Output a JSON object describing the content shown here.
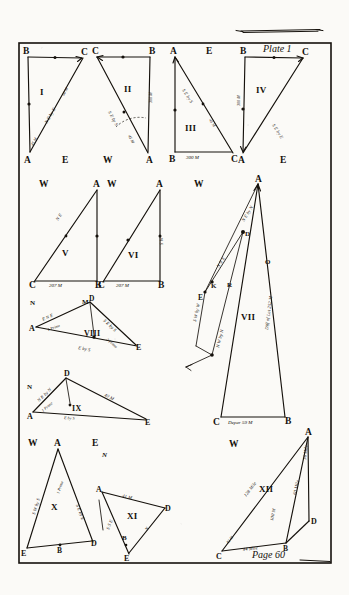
{
  "plate": {
    "title": "Plate 1",
    "page_label": "Page 60",
    "top_rule": "decorative-rule"
  },
  "figures": [
    {
      "id": "fig-1",
      "numeral": "I",
      "vertices": [
        "B",
        "C",
        "A"
      ],
      "outside_labels": [
        "E"
      ],
      "course_label": "N E by E",
      "hypotenuse_distance": "60 M",
      "leg_distance": "45 M"
    },
    {
      "id": "fig-2",
      "numeral": "II",
      "vertices": [
        "C",
        "B",
        "A"
      ],
      "outside_labels": [
        "W"
      ],
      "course_label": "S E by S",
      "hypotenuse_distance": "45 M",
      "leg_distance": "300 M",
      "has_angle_arc": true
    },
    {
      "id": "fig-3",
      "numeral": "III",
      "vertices": [
        "A",
        "B",
        "C"
      ],
      "outside_labels": [
        "E"
      ],
      "course_label": "S E by S",
      "hypotenuse_distance": "45 M",
      "base_distance": "300 M"
    },
    {
      "id": "fig-4",
      "numeral": "IV",
      "vertices": [
        "B",
        "C",
        "A"
      ],
      "outside_labels": [
        "E"
      ],
      "course_label": "S E by E",
      "hypotenuse_distance": "35 M",
      "leg_distance": "300 M"
    },
    {
      "id": "fig-5",
      "numeral": "V",
      "vertices": [
        "A",
        "C",
        "B"
      ],
      "outside_labels": [
        "W"
      ],
      "course_label": "N E",
      "base_distance": "207 M"
    },
    {
      "id": "fig-6",
      "numeral": "VI",
      "vertices": [
        "A",
        "C",
        "B"
      ],
      "outside_labels": [
        "W"
      ],
      "course_label": "S W",
      "base_distance": "207 M"
    },
    {
      "id": "fig-7",
      "numeral": "VII",
      "vertices": [
        "A",
        "C",
        "B",
        "E",
        "K",
        "R",
        "D",
        "O"
      ],
      "outside_labels": [
        "W"
      ],
      "base_distance": "Depar 59 M",
      "right_side_label": "Diff of Lat 252 M",
      "course_labels": [
        "N E by N",
        "N N E",
        "S W by W",
        "N W by N"
      ]
    },
    {
      "id": "fig-8",
      "numeral": "VIII",
      "vertices": [
        "A",
        "D",
        "M",
        "E"
      ],
      "outside_labels": [
        "N"
      ],
      "course_labels": [
        "E N E",
        "S E by S",
        "1 Prime",
        "2 Prime",
        "E by S"
      ]
    },
    {
      "id": "fig-9",
      "numeral": "IX",
      "vertices": [
        "A",
        "D",
        "E"
      ],
      "outside_labels": [
        "N"
      ],
      "course_labels": [
        "N E by N",
        "1 Prime",
        "40 M",
        "E by S"
      ]
    },
    {
      "id": "fig-10",
      "numeral": "X",
      "vertices": [
        "A",
        "E",
        "B",
        "D"
      ],
      "outside_labels": [
        "W",
        "E",
        "N"
      ],
      "course_labels": [
        "S W by S",
        "1 Prime",
        "S E by E"
      ]
    },
    {
      "id": "fig-11",
      "numeral": "XI",
      "vertices": [
        "A",
        "D",
        "E",
        "B"
      ],
      "course_labels": [
        "41 M",
        "N",
        "S S E"
      ]
    },
    {
      "id": "fig-12",
      "numeral": "XII",
      "vertices": [
        "A",
        "C",
        "B",
        "D"
      ],
      "outside_labels": [
        "W"
      ],
      "course_labels": [
        "128 Mile",
        "42 M",
        "44 Mile",
        "100 M",
        "60 Mile",
        "36 Mile"
      ]
    }
  ],
  "cardinals": {
    "west": "W",
    "east": "E",
    "north": "N"
  }
}
